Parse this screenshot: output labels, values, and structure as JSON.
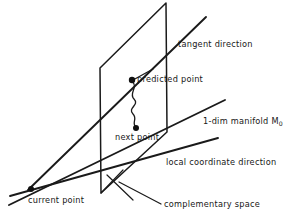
{
  "figure": {
    "type": "geometric-diagram",
    "background_color": "#ffffff",
    "ink_color": "#1a1a1a",
    "labels": {
      "tangent_direction": "tangent direction",
      "predicted_point": "predicted point",
      "manifold": "1-dim manifold M",
      "manifold_subscript": "0",
      "next_point": "next point",
      "local_coordinate_direction": "local coordinate direction",
      "current_point": "current point",
      "complementary_space": "complementary space"
    },
    "points": [
      {
        "name": "current-point",
        "x": 31,
        "y": 189,
        "radius": 3.0
      },
      {
        "name": "predicted-point",
        "x": 132,
        "y": 80,
        "radius": 3.2
      },
      {
        "name": "next-point",
        "x": 136,
        "y": 128,
        "radius": 3.0
      }
    ],
    "geometry": {
      "plane_outline": "166,3 100,68 101,193 167,132",
      "tangent_line": "28,190 206,17",
      "manifold_line": "9,205 225,100",
      "local_coordinate_line": "10,196 218,138",
      "complementary_marker_a": "101,193 122,171",
      "complementary_marker_b": "108,176 132,199",
      "complementary_leader": "119,183 162,205",
      "predicted_leader": "132,80 152,70",
      "corrector_wiggle": "132,81 C 139,88 128,93 134,99 C 140,105 127,108 133,114 C 138,119 131,123 136,127"
    }
  }
}
